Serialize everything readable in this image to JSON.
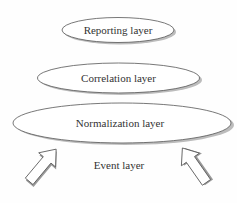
{
  "diagram": {
    "layers": [
      {
        "id": "reporting",
        "label": "Reporting layer"
      },
      {
        "id": "correlation",
        "label": "Correlation layer"
      },
      {
        "id": "normalization",
        "label": "Normalization layer"
      },
      {
        "id": "event",
        "label": "Event layer"
      }
    ],
    "arrows": [
      {
        "id": "left",
        "direction": "up-right"
      },
      {
        "id": "right",
        "direction": "up-left"
      }
    ],
    "colors": {
      "stroke": "#555555",
      "shadow": "#9a9a9a",
      "fill": "#ffffff",
      "text": "#333333"
    }
  }
}
